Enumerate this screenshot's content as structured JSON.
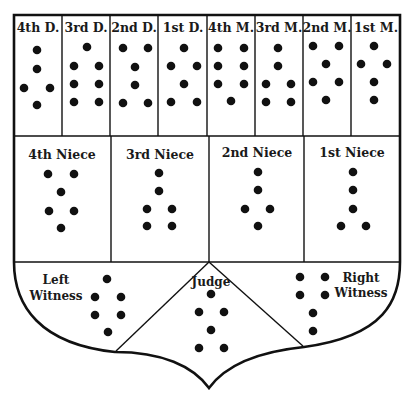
{
  "diagram": {
    "type": "geomancy-shield-chart",
    "colors": {
      "ink": "#111111",
      "background": "#ffffff"
    },
    "rows": [
      {
        "name": "mothers-and-daughters",
        "cells": [
          {
            "label": "4th D.",
            "points": 5,
            "dots": [
              [
                37,
                50
              ],
              [
                37,
                69
              ],
              [
                24,
                88
              ],
              [
                50,
                88
              ],
              [
                37,
                105
              ]
            ]
          },
          {
            "label": "3rd D.",
            "points": 7,
            "dots": [
              [
                87,
                47
              ],
              [
                74,
                66
              ],
              [
                99,
                66
              ],
              [
                74,
                84
              ],
              [
                99,
                84
              ],
              [
                74,
                102
              ],
              [
                99,
                102
              ]
            ]
          },
          {
            "label": "2nd D.",
            "points": 6,
            "dots": [
              [
                123,
                48
              ],
              [
                148,
                48
              ],
              [
                135,
                67
              ],
              [
                135,
                85
              ],
              [
                123,
                103
              ],
              [
                148,
                103
              ]
            ]
          },
          {
            "label": "1st D.",
            "points": 6,
            "dots": [
              [
                184,
                48
              ],
              [
                171,
                66
              ],
              [
                197,
                66
              ],
              [
                184,
                84
              ],
              [
                171,
                102
              ],
              [
                197,
                102
              ]
            ]
          },
          {
            "label": "4th M.",
            "points": 7,
            "dots": [
              [
                218,
                48
              ],
              [
                244,
                48
              ],
              [
                218,
                66
              ],
              [
                244,
                66
              ],
              [
                218,
                84
              ],
              [
                244,
                84
              ],
              [
                231,
                101
              ]
            ]
          },
          {
            "label": "3rd M.",
            "points": 6,
            "dots": [
              [
                278,
                48
              ],
              [
                278,
                66
              ],
              [
                266,
                84
              ],
              [
                291,
                84
              ],
              [
                266,
                102
              ],
              [
                291,
                102
              ]
            ]
          },
          {
            "label": "2nd M.",
            "points": 6,
            "dots": [
              [
                313,
                46
              ],
              [
                339,
                46
              ],
              [
                326,
                64
              ],
              [
                313,
                82
              ],
              [
                339,
                82
              ],
              [
                326,
                100
              ]
            ]
          },
          {
            "label": "1st M.",
            "points": 5,
            "dots": [
              [
                374,
                46
              ],
              [
                361,
                64
              ],
              [
                387,
                64
              ],
              [
                374,
                82
              ],
              [
                374,
                100
              ]
            ]
          }
        ]
      },
      {
        "name": "nieces",
        "cells": [
          {
            "label": "4th Niece",
            "points": 6,
            "dots": [
              [
                48,
                174
              ],
              [
                74,
                174
              ],
              [
                61,
                192
              ],
              [
                49,
                211
              ],
              [
                74,
                211
              ],
              [
                61,
                228
              ]
            ]
          },
          {
            "label": "3rd Niece",
            "points": 6,
            "dots": [
              [
                159,
                173
              ],
              [
                159,
                191
              ],
              [
                147,
                209
              ],
              [
                172,
                209
              ],
              [
                147,
                226
              ],
              [
                172,
                226
              ]
            ]
          },
          {
            "label": "2nd Niece",
            "points": 5,
            "dots": [
              [
                258,
                172
              ],
              [
                258,
                190
              ],
              [
                245,
                209
              ],
              [
                270,
                209
              ],
              [
                258,
                226
              ]
            ]
          },
          {
            "label": "1st Niece",
            "points": 5,
            "dots": [
              [
                353,
                172
              ],
              [
                353,
                190
              ],
              [
                353,
                209
              ],
              [
                341,
                226
              ],
              [
                366,
                226
              ]
            ]
          }
        ]
      },
      {
        "name": "court",
        "cells": [
          {
            "label_lines": [
              "Left",
              "Witness"
            ],
            "points": 6,
            "dots": [
              [
                107,
                279
              ],
              [
                95,
                297
              ],
              [
                121,
                297
              ],
              [
                95,
                315
              ],
              [
                121,
                315
              ],
              [
                108,
                332
              ]
            ]
          },
          {
            "label": "Judge",
            "points": 6,
            "dots": [
              [
                211,
                294
              ],
              [
                199,
                312
              ],
              [
                224,
                312
              ],
              [
                211,
                330
              ],
              [
                199,
                348
              ],
              [
                224,
                348
              ]
            ]
          },
          {
            "label_lines": [
              "Right",
              "Witness"
            ],
            "points": 6,
            "dots": [
              [
                300,
                277
              ],
              [
                325,
                277
              ],
              [
                300,
                295
              ],
              [
                325,
                295
              ],
              [
                313,
                313
              ],
              [
                313,
                331
              ]
            ]
          }
        ]
      }
    ]
  },
  "labels": {
    "d4": "4th D.",
    "d3": "3rd D.",
    "d2": "2nd D.",
    "d1": "1st D.",
    "m4": "4th M.",
    "m3": "3rd M.",
    "m2": "2nd M.",
    "m1": "1st M.",
    "n4": "4th Niece",
    "n3": "3rd Niece",
    "n2": "2nd Niece",
    "n1": "1st Niece",
    "left_witness_1": "Left",
    "left_witness_2": "Witness",
    "judge": "Judge",
    "right_witness_1": "Right",
    "right_witness_2": "Witness"
  }
}
